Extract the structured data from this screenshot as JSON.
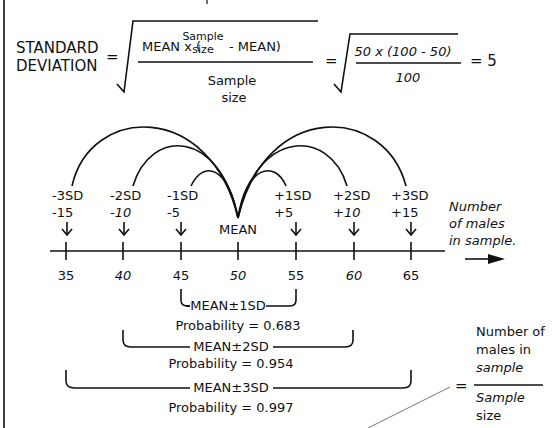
{
  "formula": {
    "lhs_line1": "STANDARD",
    "lhs_line2": "DEVIATION",
    "equals": "=",
    "numerator_left": "MEAN x (",
    "numerator_inner_top": "Sample",
    "numerator_inner_bottom": "size",
    "numerator_right": "- MEAN)",
    "denominator_top": "Sample",
    "denominator_bottom": "size",
    "equals2": "=",
    "example_numerator": "50 x (100 - 50)",
    "example_denominator": "100",
    "result": "= 5"
  },
  "axis": {
    "title_line1": "Number",
    "title_line2": "of males",
    "title_line3": "in sample.",
    "ticks": [
      "35",
      "40",
      "45",
      "50",
      "55",
      "60",
      "65"
    ],
    "markers": [
      {
        "sd": "-3SD",
        "offset": "-15"
      },
      {
        "sd": "-2SD",
        "offset": "-10"
      },
      {
        "sd": "-1SD",
        "offset": "-5"
      },
      {
        "sd": "MEAN",
        "offset": ""
      },
      {
        "sd": "+1SD",
        "offset": "+5"
      },
      {
        "sd": "+2SD",
        "offset": "+10"
      },
      {
        "sd": "+3SD",
        "offset": "+15"
      }
    ]
  },
  "ranges": [
    {
      "label": "MEAN±1SD",
      "probability": "Probability = 0.683"
    },
    {
      "label": "MEAN±2SD",
      "probability": "Probability = 0.954"
    },
    {
      "label": "MEAN±3SD",
      "probability": "Probability = 0.997"
    }
  ],
  "proportion": {
    "equals": "=",
    "numerator_line1": "Number of",
    "numerator_line2": "males in",
    "numerator_line3": "sample",
    "denominator_line1": "Sample",
    "denominator_line2": "size"
  }
}
